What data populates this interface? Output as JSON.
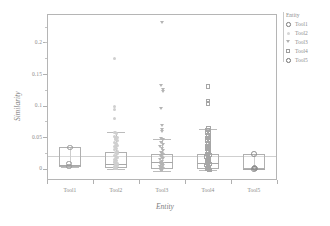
{
  "chart_data": {
    "type": "box",
    "title": "",
    "xlabel": "Entity",
    "ylabel": "Similarity",
    "categories": [
      "Tool1",
      "Tool2",
      "Tool3",
      "Tool4",
      "Tool5"
    ],
    "ylim": [
      -0.018,
      0.245
    ],
    "yticks": [
      0,
      0.05,
      0.1,
      0.15,
      0.2
    ],
    "ytick_labels": [
      "0",
      "0.05",
      "0.1",
      "0.15",
      "0.2"
    ],
    "grid": false,
    "legend": {
      "position": "right",
      "title": "Entity",
      "entries": [
        {
          "label": "Tool1",
          "marker": "circle"
        },
        {
          "label": "Tool2",
          "marker": "dot"
        },
        {
          "label": "Tool3",
          "marker": "triangle-down"
        },
        {
          "label": "Tool4",
          "marker": "square"
        },
        {
          "label": "Tool5",
          "marker": "circle-bold"
        }
      ]
    },
    "reference_line": 0.0195,
    "groups": [
      {
        "name": "Tool1",
        "marker": "circle",
        "box": {
          "q1": 0.002,
          "median": 0.0065,
          "q3": 0.0335,
          "whisker_low": 0.002,
          "whisker_high": 0.0335
        },
        "points": [
          {
            "x": 0.0,
            "y": 0.0335
          },
          {
            "x": -0.02,
            "y": 0.0075
          },
          {
            "x": -0.02,
            "y": 0.0035
          }
        ]
      },
      {
        "name": "Tool2",
        "marker": "dot",
        "box": {
          "q1": 0.0005,
          "median": 0.0075,
          "q3": 0.0265,
          "whisker_low": 0.0,
          "whisker_high": 0.0575
        },
        "points": [
          {
            "x": -0.04,
            "y": 0.175
          },
          {
            "x": -0.03,
            "y": 0.098
          },
          {
            "x": -0.03,
            "y": 0.0935
          },
          {
            "x": -0.03,
            "y": 0.079
          },
          {
            "x": -0.02,
            "y": 0.0575
          },
          {
            "x": 0.01,
            "y": 0.0555
          },
          {
            "x": -0.04,
            "y": 0.0515
          },
          {
            "x": 0.02,
            "y": 0.0495
          },
          {
            "x": -0.01,
            "y": 0.047
          },
          {
            "x": 0.03,
            "y": 0.0445
          },
          {
            "x": -0.03,
            "y": 0.042
          },
          {
            "x": 0.0,
            "y": 0.0395
          },
          {
            "x": 0.02,
            "y": 0.037
          },
          {
            "x": -0.02,
            "y": 0.0345
          },
          {
            "x": 0.01,
            "y": 0.032
          },
          {
            "x": -0.04,
            "y": 0.03
          },
          {
            "x": 0.03,
            "y": 0.0275
          },
          {
            "x": -0.01,
            "y": 0.0255
          },
          {
            "x": 0.02,
            "y": 0.0235
          },
          {
            "x": -0.03,
            "y": 0.021
          },
          {
            "x": 0.0,
            "y": 0.019
          },
          {
            "x": 0.03,
            "y": 0.017
          },
          {
            "x": -0.02,
            "y": 0.0145
          },
          {
            "x": 0.01,
            "y": 0.0125
          },
          {
            "x": -0.04,
            "y": 0.0105
          },
          {
            "x": 0.02,
            "y": 0.0085
          },
          {
            "x": -0.01,
            "y": 0.0065
          },
          {
            "x": 0.03,
            "y": 0.0045
          },
          {
            "x": -0.03,
            "y": 0.0025
          },
          {
            "x": 0.0,
            "y": 0.0008
          },
          {
            "x": 0.015,
            "y": 0.0
          },
          {
            "x": -0.02,
            "y": 0.0
          }
        ]
      },
      {
        "name": "Tool3",
        "marker": "triangle-down",
        "box": {
          "q1": 0.0,
          "median": 0.01,
          "q3": 0.0235,
          "whisker_low": -0.004,
          "whisker_high": 0.047
        },
        "points": [
          {
            "x": 0.0,
            "y": 0.232
          },
          {
            "x": -0.01,
            "y": 0.131
          },
          {
            "x": 0.02,
            "y": 0.1255
          },
          {
            "x": 0.02,
            "y": 0.122
          },
          {
            "x": -0.01,
            "y": 0.0945
          },
          {
            "x": 0.01,
            "y": 0.0675
          },
          {
            "x": 0.0,
            "y": 0.0615
          },
          {
            "x": 0.01,
            "y": 0.0585
          },
          {
            "x": -0.02,
            "y": 0.047
          },
          {
            "x": 0.02,
            "y": 0.0455
          },
          {
            "x": -0.01,
            "y": 0.0415
          },
          {
            "x": 0.03,
            "y": 0.038
          },
          {
            "x": -0.03,
            "y": 0.0345
          },
          {
            "x": 0.0,
            "y": 0.0315
          },
          {
            "x": 0.02,
            "y": 0.0285
          },
          {
            "x": -0.02,
            "y": 0.0255
          },
          {
            "x": 0.01,
            "y": 0.0235
          },
          {
            "x": 0.03,
            "y": 0.0215
          },
          {
            "x": -0.01,
            "y": 0.0195
          },
          {
            "x": 0.0,
            "y": 0.0175
          },
          {
            "x": 0.02,
            "y": 0.0155
          },
          {
            "x": -0.03,
            "y": 0.0135
          },
          {
            "x": 0.01,
            "y": 0.0115
          },
          {
            "x": -0.02,
            "y": 0.01
          },
          {
            "x": 0.03,
            "y": 0.0085
          },
          {
            "x": 0.0,
            "y": 0.007
          },
          {
            "x": -0.01,
            "y": 0.0055
          },
          {
            "x": 0.02,
            "y": 0.004
          },
          {
            "x": -0.03,
            "y": 0.0025
          },
          {
            "x": 0.01,
            "y": 0.001
          },
          {
            "x": -0.02,
            "y": 0.0
          },
          {
            "x": 0.03,
            "y": 0.0
          },
          {
            "x": 0.0,
            "y": -0.002
          },
          {
            "x": -0.01,
            "y": -0.004
          }
        ]
      },
      {
        "name": "Tool4",
        "marker": "square",
        "box": {
          "q1": 0.0,
          "median": 0.0085,
          "q3": 0.0235,
          "whisker_low": -0.002,
          "whisker_high": 0.0635
        },
        "points": [
          {
            "x": 0.0,
            "y": 0.13
          },
          {
            "x": 0.0,
            "y": 0.1075
          },
          {
            "x": 0.0,
            "y": 0.1035
          },
          {
            "x": 0.01,
            "y": 0.0635
          },
          {
            "x": -0.01,
            "y": 0.061
          },
          {
            "x": 0.02,
            "y": 0.0585
          },
          {
            "x": -0.02,
            "y": 0.056
          },
          {
            "x": 0.0,
            "y": 0.0535
          },
          {
            "x": 0.01,
            "y": 0.051
          },
          {
            "x": -0.01,
            "y": 0.0485
          },
          {
            "x": 0.02,
            "y": 0.046
          },
          {
            "x": -0.02,
            "y": 0.0435
          },
          {
            "x": 0.0,
            "y": 0.041
          },
          {
            "x": 0.01,
            "y": 0.0385
          },
          {
            "x": -0.01,
            "y": 0.036
          },
          {
            "x": 0.02,
            "y": 0.0335
          },
          {
            "x": -0.02,
            "y": 0.031
          },
          {
            "x": 0.0,
            "y": 0.0285
          },
          {
            "x": 0.01,
            "y": 0.026
          },
          {
            "x": -0.01,
            "y": 0.0235
          },
          {
            "x": 0.03,
            "y": 0.0215
          },
          {
            "x": -0.03,
            "y": 0.0195
          },
          {
            "x": 0.0,
            "y": 0.0175
          },
          {
            "x": 0.02,
            "y": 0.0155
          },
          {
            "x": -0.02,
            "y": 0.0135
          },
          {
            "x": 0.01,
            "y": 0.0115
          },
          {
            "x": -0.01,
            "y": 0.0095
          },
          {
            "x": 0.03,
            "y": 0.0075
          },
          {
            "x": -0.03,
            "y": 0.0055
          },
          {
            "x": 0.0,
            "y": 0.0035
          },
          {
            "x": 0.02,
            "y": 0.0015
          },
          {
            "x": -0.02,
            "y": 0.0
          },
          {
            "x": 0.01,
            "y": 0.0
          },
          {
            "x": -0.01,
            "y": -0.001
          },
          {
            "x": 0.03,
            "y": -0.002
          }
        ]
      },
      {
        "name": "Tool5",
        "marker": "circle-bold",
        "box": {
          "q1": -0.001,
          "median": 0.0,
          "q3": 0.0235,
          "whisker_low": -0.001,
          "whisker_high": 0.0235
        },
        "points": [
          {
            "x": 0.0,
            "y": 0.0235
          },
          {
            "x": 0.01,
            "y": 0.0015
          },
          {
            "x": 0.02,
            "y": 0.0
          },
          {
            "x": 0.0,
            "y": -0.001
          }
        ]
      }
    ]
  }
}
